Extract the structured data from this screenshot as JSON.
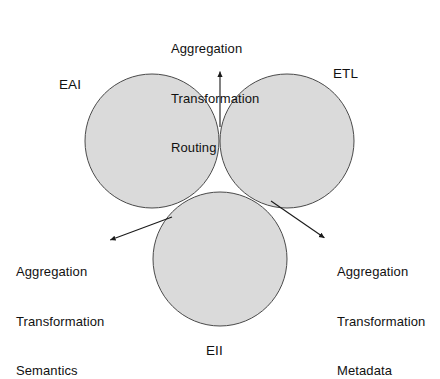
{
  "diagram": {
    "type": "venn-3-set",
    "background_color": "#ffffff",
    "circle_fill": "#dcdcdc",
    "circle_stroke": "#4a4a4a",
    "arrow_color": "#1a1a1a",
    "sets": [
      {
        "id": "eai",
        "label": "EAI",
        "label_x": 59,
        "label_y": 77,
        "cx": 152,
        "cy": 141,
        "r": 67
      },
      {
        "id": "etl",
        "label": "ETL",
        "label_x": 333,
        "label_y": 66,
        "cx": 287,
        "cy": 141,
        "r": 67
      },
      {
        "id": "eii",
        "label": "EII",
        "label_x": 206,
        "label_y": 343,
        "cx": 220,
        "cy": 259,
        "r": 67
      }
    ],
    "callouts": [
      {
        "id": "top",
        "target": "eai-etl-intersection",
        "lines": [
          "Aggregation",
          "Transformation",
          "Routing"
        ],
        "arrow": {
          "x1": 220,
          "y1": 127,
          "x2": 220,
          "y2": 66
        }
      },
      {
        "id": "left",
        "target": "eai-eii-intersection",
        "lines": [
          "Aggregation",
          "Transformation",
          "Semantics"
        ],
        "arrow": {
          "x1": 172,
          "y1": 217,
          "x2": 105,
          "y2": 242
        }
      },
      {
        "id": "right",
        "target": "etl-eii-intersection",
        "lines": [
          "Aggregation",
          "Transformation",
          "Metadata"
        ],
        "arrow": {
          "x1": 271,
          "y1": 201,
          "x2": 329,
          "y2": 241
        }
      }
    ]
  }
}
